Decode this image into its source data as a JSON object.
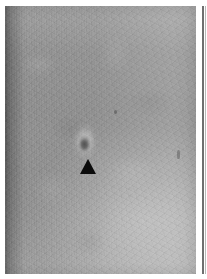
{
  "page": {
    "kind": "radiographic-film-figure",
    "width_px": 207,
    "height_px": 279,
    "background_color": "#ffffff",
    "caption": ""
  },
  "film": {
    "name": "grayscale radiograph panel",
    "left_px": 5,
    "top_px": 6,
    "width_px": 191,
    "height_px": 268,
    "base_gray": "#9b9b9b",
    "darkest_gray": "#6e6e6e",
    "lightest_gray": "#c6c6c6",
    "texture": "vertical striping with fine film grain",
    "label": ""
  },
  "annotations": {
    "arrowhead": {
      "name": "solid black triangular arrowhead pointing up at lesion",
      "color": "#0b0b0b",
      "left_px": 80,
      "top_px": 159,
      "width_px": 16,
      "height_px": 15,
      "direction": "up",
      "label": ""
    },
    "lesion": {
      "name": "focal nodular opacity with bright halo",
      "center_x_px": 85,
      "center_y_px": 141,
      "width_px": 26,
      "height_px": 38,
      "label": ""
    },
    "specks": [
      {
        "name": "small dark speck upper-middle",
        "left_px": 114,
        "top_px": 110,
        "width_px": 3,
        "height_px": 4
      },
      {
        "name": "small elongated dark mark right side",
        "left_px": 177,
        "top_px": 150,
        "width_px": 3,
        "height_px": 9
      }
    ],
    "right_edge_rule": {
      "name": "thin vertical film edge rule at right margin",
      "color": "#6f6f6f",
      "left_px": 202,
      "top_px": 6,
      "width_px": 2,
      "height_px": 268
    }
  }
}
